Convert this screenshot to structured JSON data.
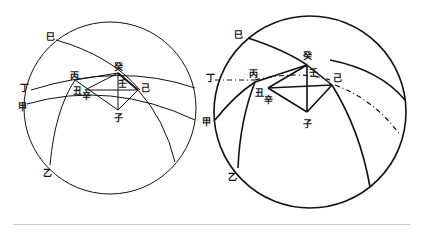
{
  "figures": {
    "left": {
      "labels": {
        "si": "巳",
        "gui": "癸",
        "bing": "丙",
        "ding": "丁",
        "jia": "甲",
        "chou": "丑",
        "xin": "辛",
        "ren": "壬",
        "ji": "己",
        "zi": "子",
        "yi": "乙"
      }
    },
    "right": {
      "labels": {
        "si": "巳",
        "gui": "癸",
        "bing": "丙",
        "ding": "丁",
        "jia": "甲",
        "chou": "丑",
        "xin": "辛",
        "ren": "壬",
        "ji": "己",
        "zi": "子",
        "yi": "乙"
      }
    }
  },
  "colors": {
    "ink": "#111111",
    "rule": "#c8c8c8",
    "background": "#ffffff"
  }
}
